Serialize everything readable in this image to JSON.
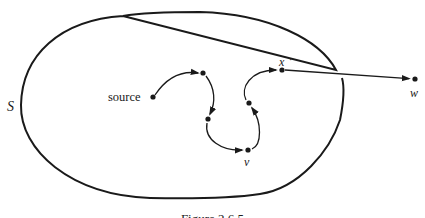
{
  "figure": {
    "caption": "Figure 2.6.5",
    "region_label": "S",
    "colors": {
      "background": "#ffffff",
      "ink": "#1a1a1a"
    }
  },
  "nodes": [
    {
      "id": "source",
      "label": "source",
      "x": 153,
      "y": 97
    },
    {
      "id": "n1",
      "label": "",
      "x": 203,
      "y": 73
    },
    {
      "id": "n2",
      "label": "",
      "x": 208,
      "y": 119
    },
    {
      "id": "v",
      "label": "v",
      "x": 248,
      "y": 150
    },
    {
      "id": "n4",
      "label": "",
      "x": 249,
      "y": 103
    },
    {
      "id": "x",
      "label": "x",
      "x": 282,
      "y": 70
    },
    {
      "id": "w",
      "label": "w",
      "x": 415,
      "y": 79
    }
  ],
  "edges": [
    {
      "from": "source",
      "to": "n1"
    },
    {
      "from": "n1",
      "to": "n2"
    },
    {
      "from": "n2",
      "to": "v"
    },
    {
      "from": "v",
      "to": "n4"
    },
    {
      "from": "n4",
      "to": "x"
    },
    {
      "from": "x",
      "to": "w"
    }
  ],
  "labels": {
    "source": "source",
    "v": "v",
    "x": "x",
    "x_mark": "·",
    "w": "w",
    "S": "S"
  }
}
